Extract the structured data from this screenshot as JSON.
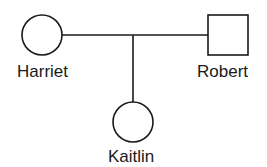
{
  "diagram": {
    "type": "pedigree",
    "individuals": [
      {
        "name": "Harriet",
        "shape": "circle",
        "sex": "female"
      },
      {
        "name": "Robert",
        "shape": "square",
        "sex": "male"
      },
      {
        "name": "Kaitlin",
        "shape": "circle",
        "sex": "female"
      }
    ],
    "relationships": [
      {
        "type": "mating",
        "between": [
          "Harriet",
          "Robert"
        ]
      },
      {
        "type": "offspring",
        "parents": [
          "Harriet",
          "Robert"
        ],
        "child": "Kaitlin"
      }
    ],
    "colors": {
      "stroke": "#1a1a1a",
      "background": "#ffffff"
    }
  }
}
